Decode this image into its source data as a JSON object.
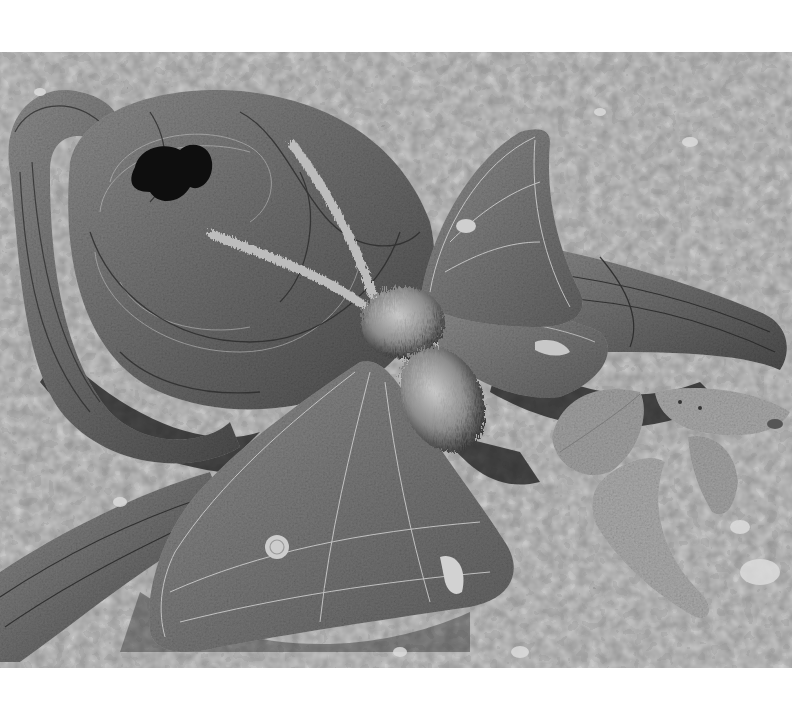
{
  "photo": {
    "subject": "Textile sculpture of a moth resting on a stitched fabric log with scattered leaves on gravel",
    "color_mode": "grayscale",
    "palette": {
      "gravel_light": "#c9c9c9",
      "gravel_mid": "#9a9a9a",
      "gravel_dark": "#5e5e5e",
      "log": "#6f6f6f",
      "log_dark": "#3c3c3c",
      "wing": "#7a7a7a",
      "wing_stitch": "#d6d6d6",
      "body_fur": "#a8a8a8",
      "leaf": "#9c9c9c",
      "shadow": "#1e1e1e",
      "margin": "#ffffff"
    },
    "elements": [
      {
        "name": "gravel-ground"
      },
      {
        "name": "log-branch-left"
      },
      {
        "name": "log-stump"
      },
      {
        "name": "log-hole"
      },
      {
        "name": "log-branch-right"
      },
      {
        "name": "log-branch-bottom-left"
      },
      {
        "name": "moth-forewing-upper"
      },
      {
        "name": "moth-hindwing-upper"
      },
      {
        "name": "moth-forewing-lower"
      },
      {
        "name": "moth-antenna-left"
      },
      {
        "name": "moth-antenna-right"
      },
      {
        "name": "moth-body"
      },
      {
        "name": "leaf-1"
      },
      {
        "name": "leaf-2"
      },
      {
        "name": "leaf-3"
      },
      {
        "name": "leaf-4"
      }
    ]
  }
}
